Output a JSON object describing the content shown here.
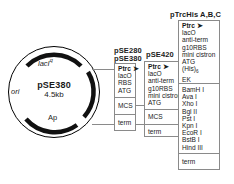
{
  "diagram": {
    "plasmid": {
      "name": "pSE380",
      "size": "4.5kb",
      "features": [
        {
          "id": "lacIq",
          "label": "lacI",
          "superscript": "q",
          "position": "top"
        },
        {
          "id": "ori",
          "label": "ori",
          "position": "left"
        },
        {
          "id": "ap",
          "label": "Ap",
          "position": "bottom"
        },
        {
          "id": "mcs-arc",
          "label": "",
          "position": "right"
        }
      ]
    },
    "columns": [
      {
        "id": "pse280-pse380",
        "headings": [
          "pSE280",
          "pSE380"
        ],
        "segments": [
          {
            "id": "promoter",
            "lines": [
              {
                "text": "Ptrc",
                "bold": true,
                "arrow": true
              },
              {
                "text": "lacO",
                "bold": false,
                "arrow": false
              },
              {
                "text": "RBS",
                "bold": false,
                "arrow": false
              },
              {
                "text": "ATG",
                "bold": false,
                "arrow": false
              }
            ]
          },
          {
            "id": "mcs",
            "lines": [
              {
                "text": "MCS",
                "bold": false,
                "arrow": false
              }
            ]
          },
          {
            "id": "terminator",
            "lines": [
              {
                "text": "term",
                "bold": false,
                "arrow": false
              }
            ]
          }
        ]
      },
      {
        "id": "pse420",
        "headings": [
          "pSE420"
        ],
        "segments": [
          {
            "id": "promoter",
            "lines": [
              {
                "text": "Ptrc",
                "bold": true,
                "arrow": true
              },
              {
                "text": "lacO",
                "bold": false,
                "arrow": false
              },
              {
                "text": "anti-term",
                "bold": false,
                "arrow": false
              },
              {
                "text": "g10RBS",
                "bold": false,
                "arrow": false
              },
              {
                "text": "mini cistron",
                "bold": false,
                "arrow": false
              },
              {
                "text": "ATG",
                "bold": false,
                "arrow": false
              }
            ]
          },
          {
            "id": "mcs",
            "lines": [
              {
                "text": "MCS",
                "bold": false,
                "arrow": false
              }
            ]
          },
          {
            "id": "terminator",
            "lines": [
              {
                "text": "term",
                "bold": false,
                "arrow": false
              }
            ]
          }
        ]
      },
      {
        "id": "ptrchis",
        "headings": [
          "pTrcHis A,B,C"
        ],
        "segments": [
          {
            "id": "promoter",
            "lines": [
              {
                "text": "Ptrc",
                "bold": true,
                "arrow": true
              },
              {
                "text": "lacO",
                "bold": false,
                "arrow": false
              },
              {
                "text": "anti-term",
                "bold": false,
                "arrow": false
              },
              {
                "text": "g10RBS",
                "bold": false,
                "arrow": false
              },
              {
                "text": "mini cistron",
                "bold": false,
                "arrow": false
              },
              {
                "text": "ATG",
                "bold": false,
                "arrow": false
              },
              {
                "text": "(His)6",
                "bold": false,
                "arrow": false
              },
              {
                "text": "EK",
                "bold": false,
                "arrow": false
              }
            ]
          },
          {
            "id": "restriction-sites",
            "lines": [
              {
                "text": "BamH I",
                "bold": false,
                "arrow": false
              },
              {
                "text": "Ava I",
                "bold": false,
                "arrow": false
              },
              {
                "text": "Xho I",
                "bold": false,
                "arrow": false
              },
              {
                "text": "Bgl II",
                "bold": false,
                "arrow": false
              },
              {
                "text": "Pst I",
                "bold": false,
                "arrow": false
              },
              {
                "text": "Kpn I",
                "bold": false,
                "arrow": false
              },
              {
                "text": "EcoR I",
                "bold": false,
                "arrow": false
              },
              {
                "text": "BstB I",
                "bold": false,
                "arrow": false
              },
              {
                "text": "Hind III",
                "bold": false,
                "arrow": false
              }
            ]
          },
          {
            "id": "terminator",
            "lines": [
              {
                "text": "term",
                "bold": false,
                "arrow": false
              }
            ]
          }
        ]
      }
    ],
    "colors": {
      "stroke": "#000000",
      "box_border": "#8a8a8a",
      "background": "#ffffff",
      "arc_fill": "#111111"
    }
  }
}
